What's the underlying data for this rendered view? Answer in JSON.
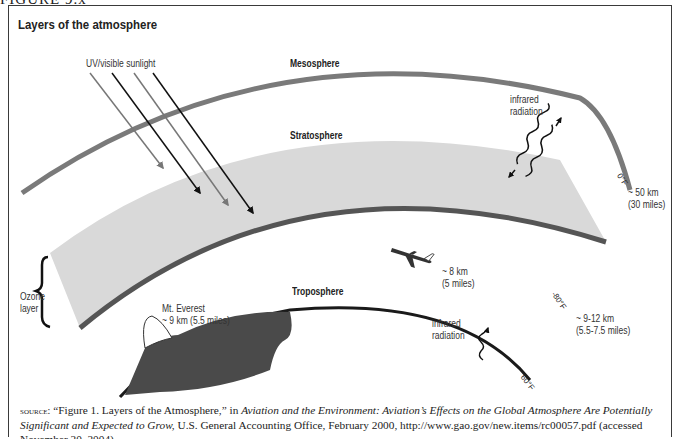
{
  "figure": {
    "label": "FIGURE 9.x",
    "title": "Layers of the atmosphere"
  },
  "layers": {
    "mesosphere": "Mesosphere",
    "stratosphere": "Stratosphere",
    "troposphere": "Troposphere",
    "ozone_line1": "Ozone",
    "ozone_line2": "layer"
  },
  "annotations": {
    "sunlight": "UV/visible sunlight",
    "infrared_top_line1": "infrared",
    "infrared_top_line2": "radiation",
    "infrared_bottom_line1": "infrared",
    "infrared_bottom_line2": "radiation",
    "everest_line1": "Mt. Everest",
    "everest_line2": "~ 9 km (5.5 miles)",
    "plane_line1": "~ 8 km",
    "plane_line2": "(5 miles)",
    "alt_50_line1": "~ 50 km",
    "alt_50_line2": "(30 miles)",
    "alt_912_line1": "~ 9-12 km",
    "alt_912_line2": "(5.5-7.5 miles)"
  },
  "temperatures": {
    "meso": "0°F",
    "strato": "-80°F",
    "tropo": "60°F"
  },
  "source": {
    "prefix": "source:",
    "quote": " “Figure 1. Layers of the Atmosphere,” in ",
    "title_italic": "Aviation and the Environment: Aviation’s Effects on the Global Atmosphere Are Potentially Significant and Expected to Grow,",
    "rest": " U.S. General Accounting Office, February 2000, http://www.gao.gov/new.items/rc00057.pdf (accessed November 20, 2004)"
  },
  "colors": {
    "mesosphere_band": "#7a7a7a",
    "stratosphere_fill": "#d9d9d9",
    "stratosphere_band": "#555555",
    "troposphere_line": "#1a1a1a",
    "mountain_fill": "#4a4a4a",
    "arrow_gray": "#777777",
    "arrow_black": "#111111"
  }
}
